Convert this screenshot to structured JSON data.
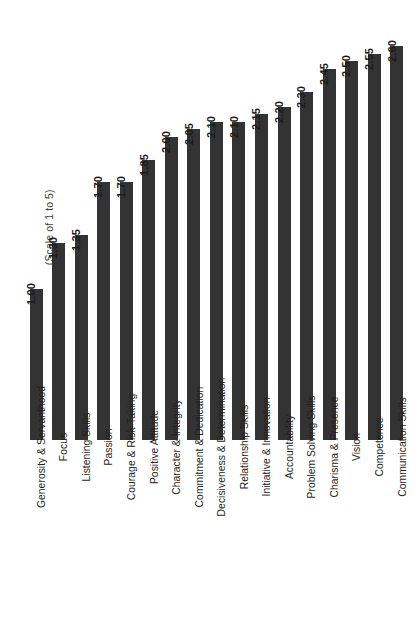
{
  "chart_data": {
    "type": "bar",
    "title": "",
    "subtitle": "",
    "xlabel": "",
    "ylabel": "(Scale of 1 to 5)",
    "orientation": "vertical",
    "grid": false,
    "legend": "none",
    "value_label_format": "0.00",
    "ylim": [
      0,
      2.75
    ],
    "bar_color": "#333333",
    "background_color": "#ffffff",
    "categories": [
      "Generosity & Servanthood",
      "Focus",
      "Listening Skills",
      "Passion",
      "Courage & Risk-Taking",
      "Positive Attitude",
      "Character & Integrity",
      "Commitment & Dedication",
      "Decisiveness & Determination",
      "Relationship Skills",
      "Initiative & Innovation",
      "Accountability",
      "Problem Solving Skills",
      "Charisma & Presence",
      "Vision",
      "Competence",
      "Communication Skills"
    ],
    "values": [
      1.0,
      1.3,
      1.35,
      1.7,
      1.7,
      1.85,
      2.0,
      2.05,
      2.1,
      2.1,
      2.15,
      2.2,
      2.3,
      2.45,
      2.5,
      2.55,
      2.6
    ],
    "value_labels": [
      "1.00",
      "1.30",
      "1.35",
      "1.70",
      "1.70",
      "1.85",
      "2.00",
      "2.05",
      "2.10",
      "2.10",
      "2.15",
      "2.20",
      "2.30",
      "2.45",
      "2.50",
      "2.55",
      "2.60"
    ]
  }
}
